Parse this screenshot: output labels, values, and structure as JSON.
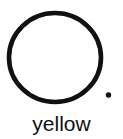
{
  "figure": {
    "background_color": "#ffffff",
    "ink_color": "#111111",
    "caption": "yellow",
    "shapes": [
      {
        "name": "circle-outline",
        "type": "ellipse",
        "cx": 55,
        "cy": 57.5,
        "rx": 46,
        "ry": 44.5,
        "stroke_width": 4.6,
        "fill": "none",
        "stroke": "#111111"
      },
      {
        "name": "period-dot",
        "type": "dot",
        "cx": 108.5,
        "cy": 95,
        "r": 2.7,
        "fill": "#111111"
      }
    ]
  }
}
